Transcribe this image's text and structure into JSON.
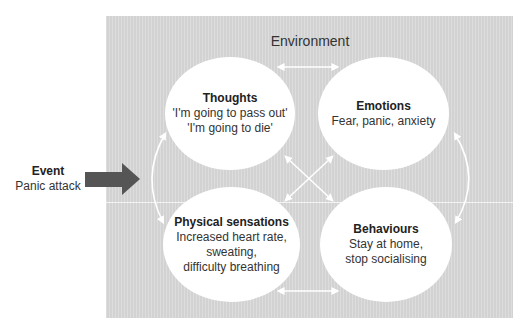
{
  "diagram": {
    "type": "cognitive-behavioural model",
    "environment_label": "Environment",
    "event": {
      "title": "Event",
      "description": "Panic attack",
      "arrow_color": "#555555"
    },
    "nodes": [
      {
        "id": "thoughts",
        "title": "Thoughts",
        "lines": [
          "'I'm going to pass out'",
          "'I'm going to die'"
        ]
      },
      {
        "id": "emotions",
        "title": "Emotions",
        "lines": [
          "Fear, panic, anxiety"
        ]
      },
      {
        "id": "physical",
        "title": "Physical sensations",
        "lines": [
          "Increased heart rate,",
          "sweating,",
          "difficulty breathing"
        ]
      },
      {
        "id": "behaviours",
        "title": "Behaviours",
        "lines": [
          "Stay at home,",
          "stop socialising"
        ]
      }
    ],
    "connections": [
      {
        "from": "thoughts",
        "to": "emotions",
        "type": "bidirectional"
      },
      {
        "from": "physical",
        "to": "behaviours",
        "type": "bidirectional"
      },
      {
        "from": "thoughts",
        "to": "physical",
        "type": "bidirectional"
      },
      {
        "from": "emotions",
        "to": "behaviours",
        "type": "bidirectional"
      },
      {
        "from": "thoughts",
        "to": "behaviours",
        "type": "bidirectional"
      },
      {
        "from": "emotions",
        "to": "physical",
        "type": "bidirectional"
      },
      {
        "from": "event",
        "to": "physical",
        "type": "directed"
      }
    ],
    "colors": {
      "background": "#d9d9d9",
      "node_fill": "#ffffff",
      "connector": "#ffffff",
      "event_arrow": "#555555"
    }
  }
}
